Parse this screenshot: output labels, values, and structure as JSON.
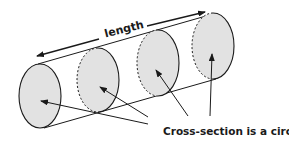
{
  "diagram": {
    "length_label": "length",
    "cross_section_label": "Cross-section is a circle",
    "colors": {
      "fill": "#e2e2e2",
      "stroke": "#1a1a1a",
      "background": "#ffffff"
    },
    "cross_sections": [
      {
        "id": "cs1",
        "style": "solid"
      },
      {
        "id": "cs2",
        "style": "dashed-back"
      },
      {
        "id": "cs3",
        "style": "dashed-back"
      },
      {
        "id": "cs4",
        "style": "dashed-back"
      }
    ]
  }
}
